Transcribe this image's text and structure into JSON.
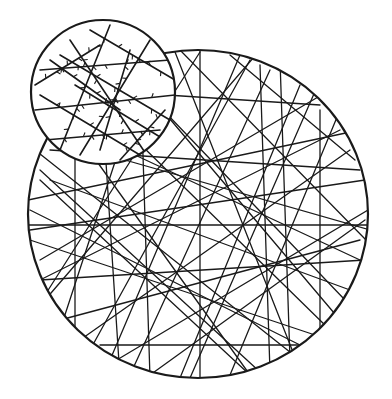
{
  "figure": {
    "background": "#ffffff",
    "ink_color": "#1a1a1a",
    "main_circle": {
      "cx": 198,
      "cy": 214,
      "rx": 170,
      "ry": 164,
      "stroke_width": 2.2
    },
    "inset_circle": {
      "cx": 103,
      "cy": 92,
      "r": 72,
      "stroke_width": 2.2
    },
    "main_fibers": [
      [
        35,
        150,
        300,
        360
      ],
      [
        28,
        200,
        360,
        130
      ],
      [
        40,
        260,
        330,
        90
      ],
      [
        60,
        110,
        250,
        375
      ],
      [
        100,
        70,
        120,
        378
      ],
      [
        150,
        55,
        60,
        330
      ],
      [
        200,
        50,
        200,
        378
      ],
      [
        250,
        60,
        90,
        350
      ],
      [
        300,
        85,
        180,
        378
      ],
      [
        340,
        130,
        40,
        280
      ],
      [
        365,
        180,
        30,
        230
      ],
      [
        360,
        260,
        60,
        120
      ],
      [
        340,
        320,
        120,
        60
      ],
      [
        290,
        360,
        280,
        60
      ],
      [
        230,
        375,
        340,
        110
      ],
      [
        150,
        375,
        365,
        220
      ],
      [
        80,
        340,
        350,
        150
      ],
      [
        45,
        300,
        260,
        50
      ],
      [
        30,
        240,
        330,
        340
      ],
      [
        55,
        140,
        370,
        230
      ],
      [
        120,
        65,
        345,
        300
      ],
      [
        175,
        52,
        300,
        370
      ],
      [
        270,
        70,
        130,
        375
      ],
      [
        320,
        105,
        90,
        90
      ],
      [
        368,
        210,
        100,
        370
      ],
      [
        350,
        290,
        50,
        180
      ],
      [
        260,
        372,
        40,
        170
      ],
      [
        190,
        378,
        320,
        80
      ],
      [
        110,
        360,
        240,
        55
      ],
      [
        60,
        320,
        360,
        240
      ],
      [
        40,
        180,
        250,
        375
      ],
      [
        90,
        95,
        330,
        330
      ],
      [
        230,
        55,
        355,
        160
      ],
      [
        310,
        350,
        30,
        210
      ],
      [
        366,
        240,
        180,
        50
      ],
      [
        140,
        60,
        150,
        378
      ],
      [
        260,
        65,
        270,
        372
      ],
      [
        320,
        110,
        320,
        340
      ],
      [
        75,
        120,
        75,
        330
      ],
      [
        28,
        225,
        368,
        225
      ],
      [
        40,
        280,
        365,
        260
      ],
      [
        50,
        150,
        360,
        170
      ],
      [
        100,
        345,
        300,
        345
      ],
      [
        200,
        52,
        45,
        295
      ]
    ],
    "inset_fibers": [
      [
        40,
        70,
        170,
        60
      ],
      [
        35,
        110,
        175,
        95
      ],
      [
        45,
        140,
        160,
        130
      ],
      [
        70,
        40,
        150,
        160
      ],
      [
        110,
        25,
        60,
        150
      ],
      [
        150,
        40,
        80,
        155
      ],
      [
        60,
        55,
        170,
        120
      ],
      [
        40,
        95,
        140,
        155
      ],
      [
        90,
        30,
        175,
        80
      ],
      [
        120,
        160,
        165,
        110
      ],
      [
        50,
        60,
        120,
        110
      ],
      [
        130,
        50,
        100,
        150
      ],
      [
        75,
        85,
        165,
        140
      ],
      [
        35,
        85,
        100,
        45
      ]
    ]
  }
}
